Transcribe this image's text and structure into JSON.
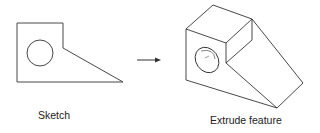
{
  "diagram": {
    "sketch_label": "Sketch",
    "extrude_label": "Extrude feature",
    "stroke_color": "#333333",
    "arrow": "right-arrow"
  }
}
